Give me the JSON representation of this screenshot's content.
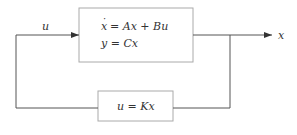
{
  "diagram": {
    "type": "block-diagram",
    "title": "",
    "plant_block": {
      "line1_lhs": "x",
      "line1_rhs": "= Ax + Bu",
      "line2": "y = Cx"
    },
    "feedback_block": {
      "label": "u = Kx"
    },
    "input_signal_label": "u",
    "output_signal_label": "x",
    "colors": {
      "line": "#555555",
      "box_border": "#aaaaaa",
      "text": "#333333"
    }
  }
}
